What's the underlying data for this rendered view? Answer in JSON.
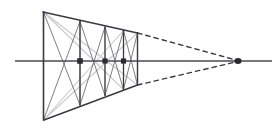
{
  "figure": {
    "canvas": {
      "width": 279,
      "height": 136,
      "background": "#ffffff"
    }
  },
  "colors": {
    "ink": "#3a3a42",
    "ink_light": "#6f6f78",
    "construction_gray": "#c9c9cf",
    "dot": "#2b2b30",
    "horizon": "#4a4a52",
    "background": "#ffffff"
  },
  "chart_data": {
    "type": "diagram",
    "xlim": [
      0,
      279
    ],
    "ylim": [
      0,
      136
    ],
    "grid": false,
    "legend": null,
    "points": {
      "vanishing_point": {
        "label": "VP",
        "x": 238,
        "y": 61
      },
      "near_top_left": {
        "label": "A",
        "x": 43,
        "y": 12
      },
      "near_bottom_left": {
        "label": "B",
        "x": 44,
        "y": 120
      },
      "horizon_left_end": {
        "x": 15,
        "y": 61
      },
      "horizon_right_end": {
        "x": 272,
        "y": 61
      }
    },
    "verticals": [
      {
        "name": "bay-0-left-edge",
        "x": 43.5,
        "y_top": 12,
        "y_bottom": 120
      },
      {
        "name": "bay-1-divider",
        "x": 80,
        "y_top": 21.5,
        "y_bottom": 105
      },
      {
        "name": "bay-2-divider",
        "x": 105,
        "y_top": 27,
        "y_bottom": 95.5
      },
      {
        "name": "bay-3-divider",
        "x": 123.5,
        "y_top": 30.5,
        "y_bottom": 89.5
      },
      {
        "name": "bay-4-far-edge",
        "x": 137.5,
        "y_top": 33,
        "y_bottom": 85
      }
    ],
    "horizon_dots": [
      {
        "name": "dot-bay-1",
        "x": 80,
        "y": 61
      },
      {
        "name": "dot-bay-2",
        "x": 105,
        "y": 61
      },
      {
        "name": "dot-bay-3",
        "x": 123.5,
        "y": 61
      },
      {
        "name": "dot-vanishing-point",
        "x": 238,
        "y": 61
      }
    ],
    "receding_edges": [
      {
        "name": "top-edge-solid",
        "from": [
          43,
          12
        ],
        "to": [
          137.5,
          33
        ],
        "style": "solid"
      },
      {
        "name": "bottom-edge-solid",
        "from": [
          44,
          120
        ],
        "to": [
          137.5,
          85
        ],
        "style": "solid"
      },
      {
        "name": "top-edge-dashed-to-vp",
        "from": [
          137.5,
          33
        ],
        "to": [
          238,
          61
        ],
        "style": "dashed"
      },
      {
        "name": "bottom-edge-dashed-to-vp",
        "from": [
          137.5,
          85
        ],
        "to": [
          238,
          61
        ],
        "style": "dashed"
      }
    ],
    "horizon_line": {
      "name": "horizon",
      "from": [
        15,
        61
      ],
      "to": [
        272,
        61
      ],
      "style": "solid"
    },
    "bay_diagonals": [
      {
        "bay": 1,
        "from": [
          43.5,
          12
        ],
        "to": [
          80,
          105
        ]
      },
      {
        "bay": 1,
        "from": [
          43.5,
          120
        ],
        "to": [
          80,
          21.5
        ]
      },
      {
        "bay": 2,
        "from": [
          80,
          21.5
        ],
        "to": [
          105,
          95.5
        ]
      },
      {
        "bay": 2,
        "from": [
          80,
          105
        ],
        "to": [
          105,
          27
        ]
      },
      {
        "bay": 3,
        "from": [
          105,
          27
        ],
        "to": [
          123.5,
          89.5
        ]
      },
      {
        "bay": 3,
        "from": [
          105,
          95.5
        ],
        "to": [
          123.5,
          30.5
        ]
      },
      {
        "bay": 4,
        "from": [
          123.5,
          30.5
        ],
        "to": [
          137.5,
          85
        ]
      },
      {
        "bay": 4,
        "from": [
          123.5,
          89.5
        ],
        "to": [
          137.5,
          33
        ]
      }
    ],
    "construction_lines": [
      {
        "name": "long-diagonal-down",
        "from": [
          43.5,
          12
        ],
        "to": [
          137.5,
          85
        ],
        "style": "light"
      },
      {
        "name": "long-diagonal-up",
        "from": [
          43.5,
          120
        ],
        "to": [
          137.5,
          33
        ],
        "style": "light"
      },
      {
        "name": "half-diagonal-a",
        "from": [
          43.5,
          12
        ],
        "to": [
          123.5,
          89.5
        ],
        "style": "light"
      },
      {
        "name": "half-diagonal-b",
        "from": [
          43.5,
          120
        ],
        "to": [
          123.5,
          30.5
        ],
        "style": "light"
      }
    ]
  }
}
